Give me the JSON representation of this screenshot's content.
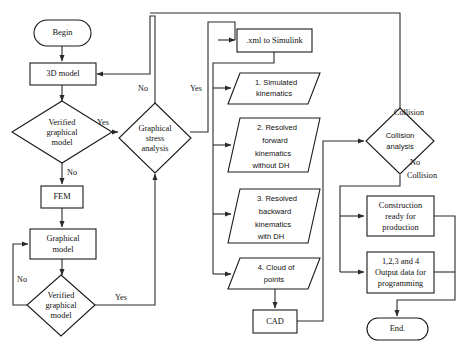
{
  "diagram": {
    "type": "flowchart",
    "width": 467,
    "height": 347,
    "background_color": "#ffffff",
    "stroke_color": "#1a1a1a",
    "text_color": "#111111"
  },
  "nodes": {
    "begin": {
      "label": "Begin",
      "shape": "terminator"
    },
    "model_3d": {
      "label": "3D model",
      "shape": "process"
    },
    "verified_graphical_model_1": {
      "label": "Verified graphical model",
      "line1": "Verified",
      "line2": "graphical",
      "line3": "model",
      "shape": "decision"
    },
    "fem": {
      "label": "FEM",
      "shape": "process"
    },
    "graphical_model": {
      "label": "Graphical model",
      "line1": "Graphical",
      "line2": "model",
      "shape": "process"
    },
    "verified_graphical_model_2": {
      "label": "Verified graphical model",
      "line1": "Verified",
      "line2": "graphical",
      "line3": "model",
      "shape": "decision"
    },
    "graphical_stress_analysis": {
      "label": "Graphical stress analysis",
      "line1": "Graphical",
      "line2": "stress",
      "line3": "analysis",
      "shape": "decision"
    },
    "xml_to_simulink": {
      "label": ".xml to Simulink",
      "shape": "process"
    },
    "simulated_kinematics": {
      "label": "1. Simulated kinematics",
      "line1": "1. Simulated",
      "line2": "kinematics",
      "shape": "data"
    },
    "resolved_forward_kinematics": {
      "label": "2. Resolved forward kinematics without DH",
      "line1": "2. Resolved",
      "line2": "forward",
      "line3": "kinematics",
      "line4": "without DH",
      "shape": "data"
    },
    "resolved_backward_kinematics": {
      "label": "3. Resolved backward kinematics with DH",
      "line1": "3. Resolved",
      "line2": "backward",
      "line3": "kinematics",
      "line4": "with DH",
      "shape": "data"
    },
    "cloud_of_points": {
      "label": "4. Cloud of points",
      "line1": "4. Cloud of",
      "line2": "points",
      "shape": "data"
    },
    "cad": {
      "label": "CAD",
      "shape": "process"
    },
    "collision_analysis": {
      "label": "Collision analysis",
      "line1": "Collision",
      "line2": "analysis",
      "shape": "decision"
    },
    "construction_ready": {
      "label": "Construction ready for production",
      "line1": "Construction",
      "line2": "ready for",
      "line3": "production",
      "shape": "process"
    },
    "output_data": {
      "label": "1,2,3 and 4 Output data for programming",
      "line1": "1,2,3 and 4",
      "line2": "Output data for",
      "line3": "programming",
      "shape": "process"
    },
    "end": {
      "label": "End.",
      "shape": "terminator"
    }
  },
  "edge_labels": {
    "verified_1_yes": "Yes",
    "verified_1_no": "No",
    "verified_2_yes": "Yes",
    "verified_2_no": "No",
    "stress_yes": "Yes",
    "stress_no": "No",
    "collision_yes": "Collision",
    "collision_no_line1": "No",
    "collision_no_line2": "Collision"
  }
}
